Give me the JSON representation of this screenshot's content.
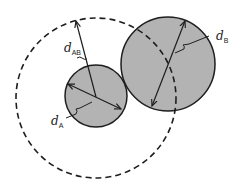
{
  "diagram": {
    "colors": {
      "sphere_fill": "#b3b3b3",
      "stroke": "#1e1e1e",
      "background": "#ffffff"
    },
    "labels": {
      "d_A": {
        "base": "d",
        "sub": "A"
      },
      "d_B": {
        "base": "d",
        "sub": "B"
      },
      "d_AB": {
        "base": "d",
        "sub": "AB"
      }
    }
  }
}
